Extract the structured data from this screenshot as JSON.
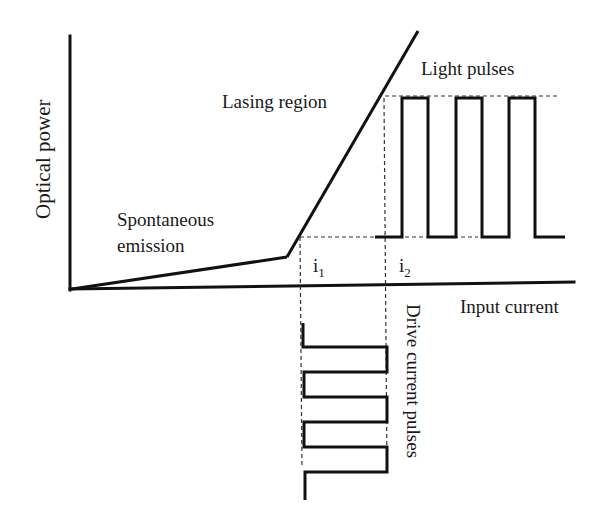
{
  "diagram": {
    "axes": {
      "y_label": "Optical power",
      "x_label": "Input current"
    },
    "regions": {
      "spontaneous_line1": "Spontaneous",
      "spontaneous_line2": "emission",
      "lasing": "Lasing region"
    },
    "markers": {
      "i1_base": "i",
      "i1_sub": "1",
      "i2_base": "i",
      "i2_sub": "2"
    },
    "pulses": {
      "light": "Light pulses",
      "drive": "Drive current pulses",
      "light_pulse_count": 3,
      "drive_pulse_count": 3
    },
    "colors": {
      "line": "#111111",
      "dashed": "#333333",
      "text": "#1a1a1a"
    }
  }
}
